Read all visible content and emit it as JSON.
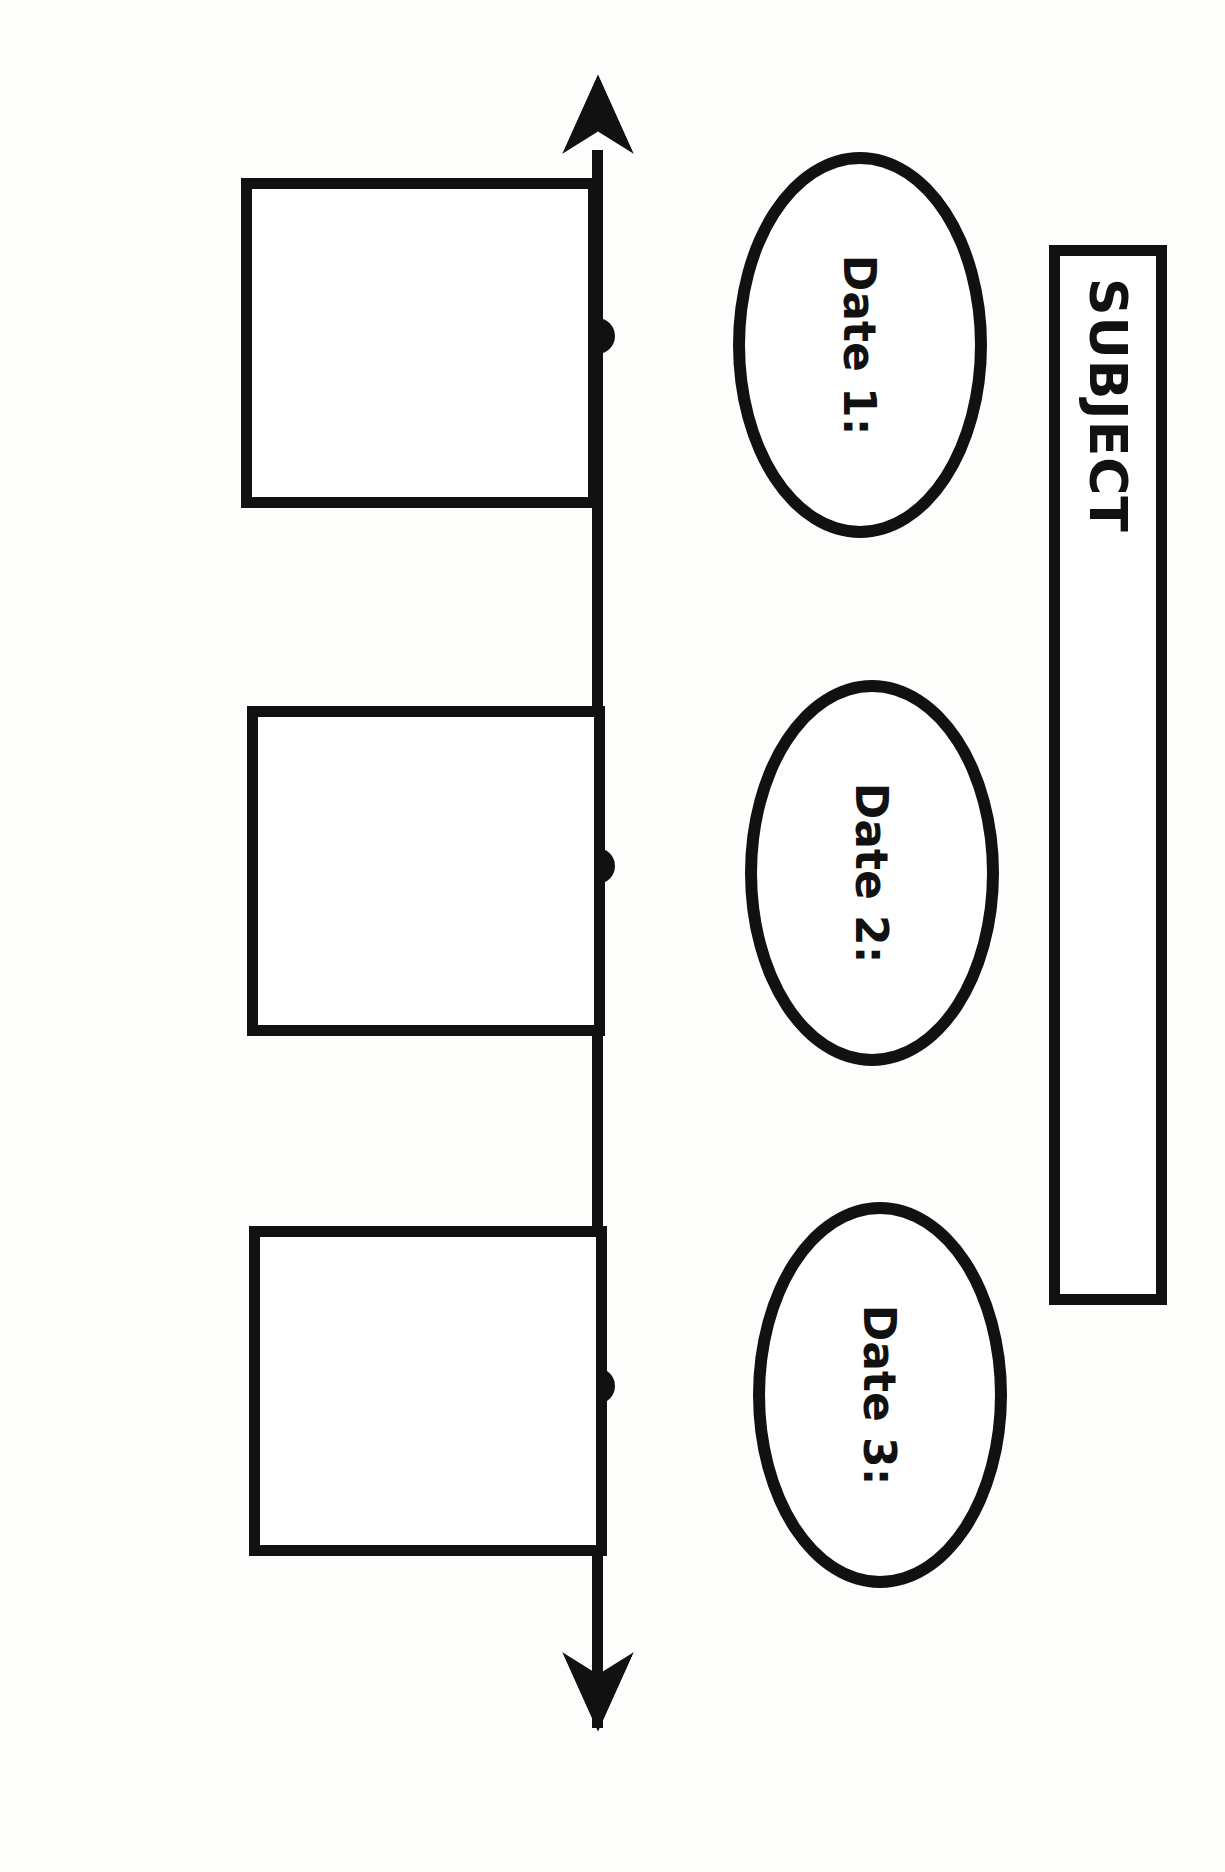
{
  "document": {
    "type": "timeline-graphic-organizer",
    "title_box": {
      "label": "SUBJECT",
      "value": ""
    },
    "timeline": {
      "orientation": "horizontal",
      "arrow_style": "double-headed",
      "node_count": 3
    },
    "entries": [
      {
        "id": 1,
        "date_label": "Date 1:",
        "date_value": "",
        "description": ""
      },
      {
        "id": 2,
        "date_label": "Date 2:",
        "date_value": "",
        "description": ""
      },
      {
        "id": 3,
        "date_label": "Date 3:",
        "date_value": "",
        "description": ""
      }
    ],
    "colors": {
      "ink": "#111111",
      "paper": "#fdfdfc"
    }
  }
}
